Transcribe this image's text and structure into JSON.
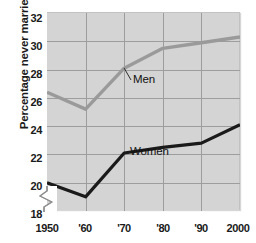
{
  "chart_data": {
    "type": "line",
    "title": "",
    "xlabel": "",
    "ylabel": "Percentage never married",
    "x": [
      1950,
      1960,
      1970,
      1980,
      1990,
      2000
    ],
    "xticklabels": [
      "1950",
      "'60",
      "'70",
      "'80",
      "'90",
      "2000"
    ],
    "yticks": [
      18,
      20,
      22,
      24,
      26,
      28,
      30,
      32
    ],
    "yticklabels": [
      "18",
      "20",
      "22",
      "24",
      "26",
      "28",
      "30",
      "32"
    ],
    "ylim": [
      18,
      32
    ],
    "xlim": [
      1950,
      2000
    ],
    "y_axis_break": true,
    "grid": true,
    "legend_position": "inline-annotations",
    "series": [
      {
        "name": "Men",
        "color": "#9a9a9a",
        "values": [
          26.4,
          25.2,
          28.1,
          29.5,
          29.9,
          30.3
        ],
        "label_anchor_year": 1970,
        "label_anchor_value": 28.1
      },
      {
        "name": "Women",
        "color": "#1a1a1a",
        "values": [
          20.0,
          19.0,
          22.1,
          22.5,
          22.8,
          24.1
        ],
        "label_anchor_year": 1970,
        "label_anchor_value": 22.1
      }
    ]
  },
  "axis": {
    "y_title": "Percentage never married",
    "y_labels": [
      "32",
      "30",
      "28",
      "26",
      "24",
      "22",
      "20",
      "18"
    ],
    "x_labels": [
      "1950",
      "'60",
      "'70",
      "'80",
      "'90",
      "2000"
    ]
  },
  "annotations": {
    "men_label": "Men",
    "women_label": "Women"
  },
  "colors": {
    "plot_background": "#d4d4d4",
    "gridline": "#9d9d9d",
    "men_line": "#9a9a9a",
    "women_line": "#1a1a1a",
    "text": "#1a1a1a"
  }
}
